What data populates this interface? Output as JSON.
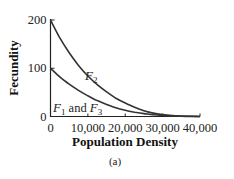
{
  "chart_data": {
    "type": "line",
    "title": "",
    "caption": "(a)",
    "xlabel": "Population Density",
    "ylabel": "Fecundity",
    "xlim": [
      0,
      40000
    ],
    "ylim": [
      0,
      200
    ],
    "x_ticks": [
      0,
      10000,
      20000,
      30000,
      40000
    ],
    "x_tick_labels": [
      "0",
      "10,000",
      "20,000",
      "30,000",
      "40,000"
    ],
    "y_ticks": [
      0,
      100,
      200
    ],
    "y_tick_labels": [
      "0",
      "100",
      "200"
    ],
    "grid": false,
    "legend": "inline curve labels",
    "x": [
      0,
      2500,
      5000,
      7500,
      10000,
      12500,
      15000,
      17500,
      20000,
      22500,
      25000,
      27500,
      30000,
      32500,
      35000,
      37500,
      40000
    ],
    "series": [
      {
        "name": "F2",
        "label_main": "F",
        "label_sub": "2",
        "values": [
          200,
          163,
          132,
          106,
          84,
          66,
          51,
          38,
          28,
          19,
          12,
          7,
          4,
          2,
          1,
          0.5,
          0
        ]
      },
      {
        "name": "F1 and F3",
        "label_main_1": "F",
        "label_sub_1": "1",
        "label_mid": " and ",
        "label_main_2": "F",
        "label_sub_2": "3",
        "values": [
          100,
          82,
          67,
          54,
          43,
          33,
          25,
          18,
          13,
          9,
          6,
          3.5,
          2,
          1,
          0.5,
          0.2,
          0
        ]
      }
    ]
  }
}
